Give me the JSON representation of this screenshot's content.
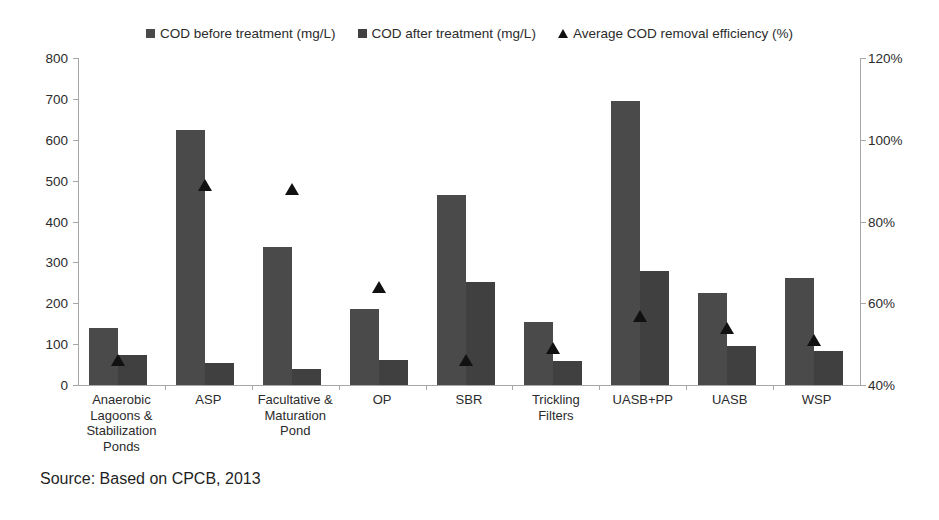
{
  "legend": {
    "items": [
      {
        "label": "COD before treatment (mg/L)",
        "marker": "square-swatch-icon",
        "color": "#4a4a4a"
      },
      {
        "label": "COD after treatment (mg/L)",
        "marker": "square-swatch-icon",
        "color": "#404040"
      },
      {
        "label": "Average COD removal efficiency (%)",
        "marker": "triangle-marker-icon",
        "color": "#111111"
      }
    ]
  },
  "source_note": "Source: Based on CPCB, 2013",
  "axes": {
    "left_ticks": [
      "0",
      "100",
      "200",
      "300",
      "400",
      "500",
      "600",
      "700",
      "800"
    ],
    "right_ticks": [
      "40%",
      "60%",
      "80%",
      "100%",
      "120%"
    ]
  },
  "chart_data": {
    "type": "bar",
    "title": "",
    "xlabel": "",
    "ylabel": "",
    "y2label": "",
    "ylim": [
      0,
      800
    ],
    "y2lim": [
      40,
      120
    ],
    "grid": false,
    "legend_position": "top-center",
    "categories": [
      "Anaerobic Lagoons & Stabilization Ponds",
      "ASP",
      "Facultative & Maturation Pond",
      "OP",
      "SBR",
      "Trickling Filters",
      "UASB+PP",
      "UASB",
      "WSP"
    ],
    "series": [
      {
        "name": "COD before treatment (mg/L)",
        "type": "bar",
        "axis": "left",
        "color": "#4a4a4a",
        "values": [
          140,
          625,
          337,
          185,
          465,
          155,
          695,
          225,
          262
        ]
      },
      {
        "name": "COD after treatment (mg/L)",
        "type": "bar",
        "axis": "left",
        "color": "#404040",
        "values": [
          73,
          55,
          40,
          60,
          252,
          58,
          280,
          95,
          83
        ]
      },
      {
        "name": "Average COD removal efficiency (%)",
        "type": "scatter",
        "axis": "right",
        "color": "#111111",
        "values": [
          46,
          89,
          88,
          64,
          46,
          49,
          57,
          54,
          51
        ]
      }
    ]
  }
}
